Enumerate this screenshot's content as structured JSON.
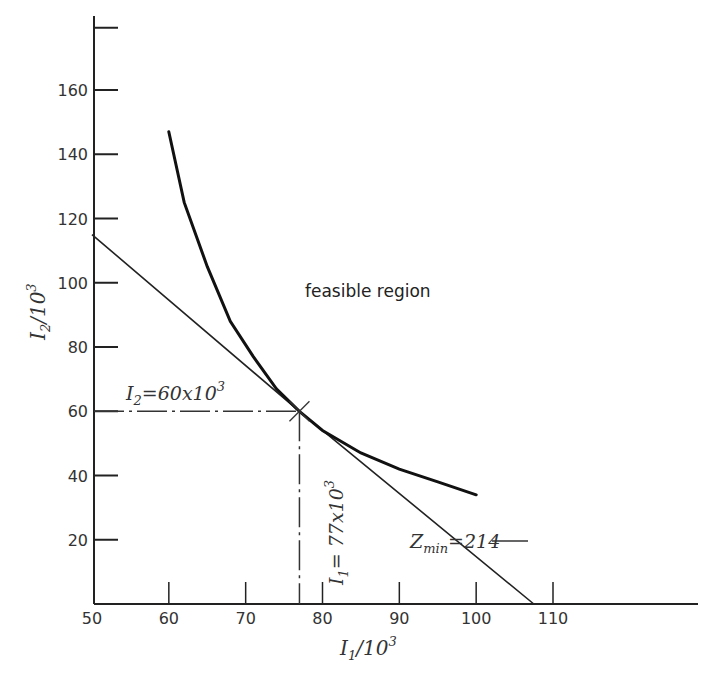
{
  "chart_data": {
    "type": "line",
    "title": "",
    "xlabel": "I1/10^3",
    "ylabel": "I2/10^3",
    "xlim": [
      50,
      115
    ],
    "ylim": [
      0,
      180
    ],
    "grid": false,
    "x_ticks": [
      "50",
      "60",
      "70",
      "80",
      "90",
      "100",
      "110"
    ],
    "y_ticks": [
      "20",
      "40",
      "60",
      "80",
      "100",
      "120",
      "140",
      "160"
    ],
    "series": [
      {
        "name": "constraint curve (feasible region boundary)",
        "type": "curve",
        "x": [
          60,
          62,
          65,
          68,
          71,
          74,
          77,
          80,
          85,
          90,
          95,
          100
        ],
        "y": [
          147,
          125,
          105,
          88,
          77,
          67,
          60,
          54,
          47,
          42,
          38,
          34
        ]
      },
      {
        "name": "objective line Z_min = 214",
        "type": "line",
        "x": [
          50,
          77,
          107.5
        ],
        "y": [
          115,
          60,
          0
        ]
      }
    ],
    "annotations": [
      {
        "text": "feasible region",
        "x": 82,
        "y": 87
      },
      {
        "text": "I2 = 60 x 10^3",
        "x": 55,
        "y": 65,
        "note": "dash-dot horizontal line at I2=60 from axis to optimum"
      },
      {
        "text": "I1 = 77 x 10^3",
        "x": 76,
        "y": 30,
        "note": "vertical line at I1=77 from axis to optimum"
      },
      {
        "text": "Zmin = 214",
        "x": 86,
        "y": 25
      }
    ],
    "optimum": {
      "x": 77,
      "y": 60
    }
  },
  "labels": {
    "y_axis": {
      "main": "I",
      "sub": "2",
      "rest": "/10",
      "sup": "3"
    },
    "x_axis": {
      "main": "I",
      "sub": "1",
      "rest": "/10",
      "sup": "3"
    },
    "feasible": "feasible region",
    "i2_anno": {
      "main": "I",
      "sub": "2",
      "rest": "=60x10",
      "sup": "3"
    },
    "i1_anno": {
      "main": "I",
      "sub": "1",
      "rest": "= 77x10",
      "sup": "3"
    },
    "zmin": {
      "main": "Z",
      "sub": "min",
      "rest": "=214"
    }
  }
}
